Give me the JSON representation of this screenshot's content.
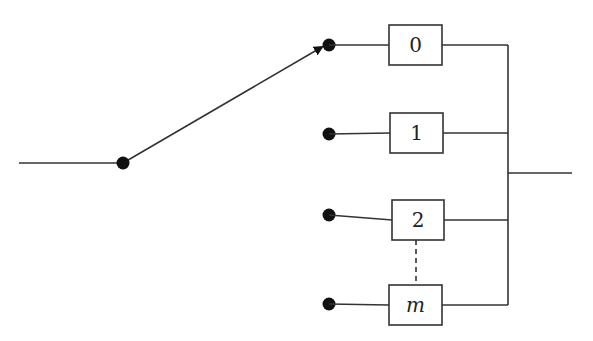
{
  "diagram": {
    "type": "switch-selector",
    "colors": {
      "line": "#333333",
      "dot": "#111111",
      "background": "#ffffff"
    },
    "input": {
      "x1": 19,
      "x2": 123,
      "y": 163
    },
    "pivot": {
      "x": 123,
      "y": 163
    },
    "switch_arm": {
      "x1": 123,
      "y1": 163,
      "x2": 322,
      "y2": 47
    },
    "branches": [
      {
        "label": "0",
        "italic": false,
        "dot": {
          "x": 329,
          "y": 45
        },
        "box": {
          "x": 389,
          "y": 25,
          "w": 53,
          "h": 40
        }
      },
      {
        "label": "1",
        "italic": false,
        "dot": {
          "x": 329,
          "y": 134
        },
        "box": {
          "x": 390,
          "y": 113,
          "w": 53,
          "h": 40
        }
      },
      {
        "label": "2",
        "italic": false,
        "dot": {
          "x": 329,
          "y": 215
        },
        "box": {
          "x": 392,
          "y": 200,
          "w": 52,
          "h": 40
        }
      },
      {
        "label": "m",
        "italic": true,
        "dot": {
          "x": 329,
          "y": 304
        },
        "box": {
          "x": 389,
          "y": 285,
          "w": 53,
          "h": 40
        }
      }
    ],
    "ellipsis_link": {
      "x": 416,
      "y1": 240,
      "y2": 285,
      "style": "dashed"
    },
    "bus": {
      "x": 508,
      "y1": 45,
      "y2": 305
    },
    "output": {
      "x1": 508,
      "x2": 572,
      "y": 173
    }
  }
}
